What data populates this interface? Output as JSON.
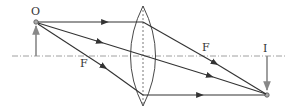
{
  "diagram": {
    "labels": {
      "object": "O",
      "image": "I",
      "focus_left": "F",
      "focus_right": "F"
    },
    "colors": {
      "ray": "#333333",
      "arrow": "#888888",
      "axis": "#777777",
      "lens": "#333333"
    }
  }
}
